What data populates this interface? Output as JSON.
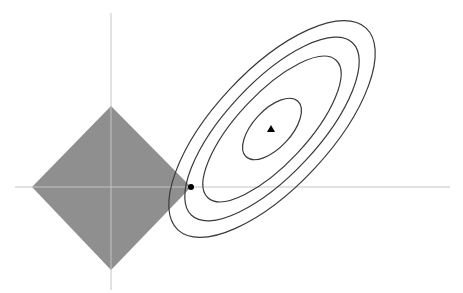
{
  "diagram": {
    "colors": {
      "background": "#ffffff",
      "axis": "#c4c4c4",
      "diamond_fill": "#8f8f8f",
      "contour_stroke": "#3a3a3a",
      "point": "#000000"
    },
    "axes": {
      "horizontal": {
        "x1": 15,
        "x2": 450,
        "y": 187
      },
      "vertical": {
        "x": 111,
        "y1": 13,
        "y2": 290
      }
    },
    "constraint_region": {
      "shape": "diamond",
      "center": [
        111,
        187
      ],
      "top": [
        111,
        106
      ],
      "right": [
        191,
        187
      ],
      "bottom": [
        111,
        270
      ],
      "left": [
        32,
        187
      ]
    },
    "contours": {
      "center": [
        272,
        129
      ],
      "rotation_deg": -47,
      "ellipses": [
        {
          "rx": 138,
          "ry": 58
        },
        {
          "rx": 118,
          "ry": 46
        },
        {
          "rx": 94,
          "ry": 35
        },
        {
          "rx": 38,
          "ry": 19
        }
      ]
    },
    "unconstrained_optimum": {
      "marker": "triangle",
      "x": 271,
      "y": 129
    },
    "constrained_solution": {
      "marker": "dot",
      "x": 191,
      "y": 187
    }
  }
}
